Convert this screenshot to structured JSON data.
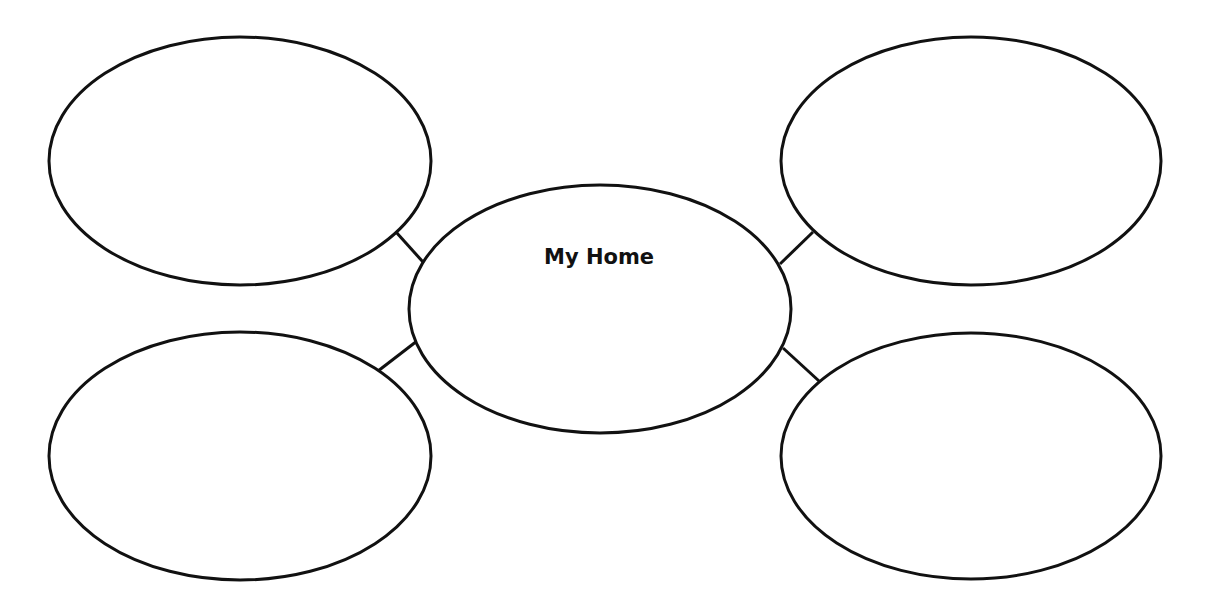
{
  "diagram": {
    "type": "bubble-map",
    "stroke_color": "#111111",
    "background": "#ffffff",
    "center": {
      "label": "My Home",
      "cx": 600,
      "cy": 309,
      "rx": 191,
      "ry": 124,
      "label_x": 599,
      "label_y": 257
    },
    "bubbles": [
      {
        "id": "top-left",
        "label": "",
        "cx": 240,
        "cy": 161,
        "rx": 191,
        "ry": 124
      },
      {
        "id": "top-right",
        "label": "",
        "cx": 971,
        "cy": 161,
        "rx": 190,
        "ry": 124
      },
      {
        "id": "bottom-left",
        "label": "",
        "cx": 240,
        "cy": 456,
        "rx": 191,
        "ry": 124
      },
      {
        "id": "bottom-right",
        "label": "",
        "cx": 971,
        "cy": 456,
        "rx": 190,
        "ry": 123
      }
    ],
    "connectors": [
      {
        "from": "top-left",
        "x1": 396,
        "y1": 232,
        "x2": 423,
        "y2": 262
      },
      {
        "from": "top-right",
        "x1": 813,
        "y1": 232,
        "x2": 780,
        "y2": 264
      },
      {
        "from": "bottom-left",
        "x1": 378,
        "y1": 371,
        "x2": 417,
        "y2": 341
      },
      {
        "from": "bottom-right",
        "x1": 783,
        "y1": 348,
        "x2": 819,
        "y2": 381
      }
    ]
  }
}
